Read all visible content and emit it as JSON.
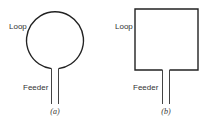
{
  "figure": {
    "panels": [
      {
        "shape": "circle",
        "loop_label": "Loop",
        "feeder_label": "Feeder",
        "caption": "(a)"
      },
      {
        "shape": "square",
        "loop_label": "Loop",
        "feeder_label": "Feeder",
        "caption": "(b)"
      }
    ],
    "stroke_color": "#222222",
    "text_color": "#333333"
  }
}
